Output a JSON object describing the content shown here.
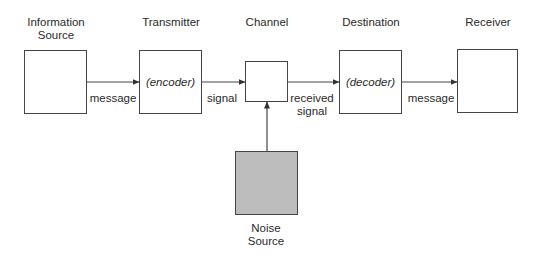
{
  "diagram": {
    "title_labels": {
      "source": "Information\nSource",
      "transmitter": "Transmitter",
      "channel": "Channel",
      "destination": "Destination",
      "receiver": "Receiver",
      "noise": "Noise\nSource"
    },
    "nodes": [
      {
        "id": "source",
        "label_line1": "Information",
        "label_line2": "Source",
        "inner": ""
      },
      {
        "id": "transmitter",
        "label_line1": "Transmitter",
        "inner": "(encoder)"
      },
      {
        "id": "channel",
        "label_line1": "Channel",
        "inner": ""
      },
      {
        "id": "destination",
        "label_line1": "Destination",
        "inner": "(decoder)"
      },
      {
        "id": "receiver",
        "label_line1": "Receiver",
        "inner": ""
      },
      {
        "id": "noise",
        "label_line1": "Noise",
        "label_line2": "Source",
        "inner": ""
      }
    ],
    "edges": [
      {
        "from": "source",
        "to": "transmitter",
        "label_line1": "message"
      },
      {
        "from": "transmitter",
        "to": "channel",
        "label_line1": "signal"
      },
      {
        "from": "channel",
        "to": "destination",
        "label_line1": "received",
        "label_line2": "signal"
      },
      {
        "from": "destination",
        "to": "receiver",
        "label_line1": "message"
      },
      {
        "from": "noise",
        "to": "channel",
        "label_line1": ""
      }
    ],
    "colors": {
      "line": "#444444",
      "noise_fill": "#bdbdbd",
      "box_fill": "#ffffff",
      "text": "#2a2a2a"
    }
  }
}
